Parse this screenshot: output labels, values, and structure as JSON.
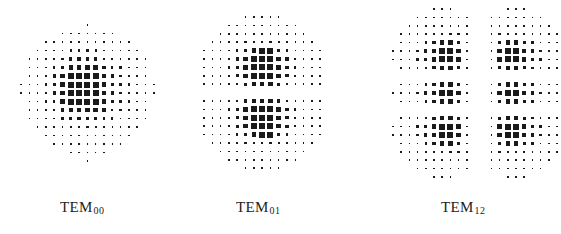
{
  "figure": {
    "panels": [
      {
        "id": "tem00",
        "label_main": "TEM",
        "label_sub": "00",
        "origin_x": 21,
        "origin_y": 25,
        "pitch_x": 8.3,
        "pitch_y": 8.5,
        "label_x": 60,
        "label_y": 199,
        "rows": [
          "00000000100000000",
          "00000111111100000",
          "00011111111111000",
          "00111122221111100",
          "01111233332211110",
          "01112344443221110",
          "01123455554322110",
          "11123455554332111",
          "11123455554322111",
          "01122455554322110",
          "01112344443221110",
          "01111233332211110",
          "00111122221111100",
          "00011111111111000",
          "00001111111110000",
          "00000011111000000",
          "00000000100000000"
        ]
      },
      {
        "id": "tem01",
        "label_main": "TEM",
        "label_sub": "01",
        "origin_x": 204,
        "origin_y": 17,
        "pitch_x": 8.3,
        "pitch_y": 8.4,
        "label_x": 236,
        "label_y": 199,
        "rows": [
          "000001111100000",
          "000111111111000",
          "001111111111100",
          "011112222211110",
          "111123455321111",
          "111234555432111",
          "111234555432111",
          "111234555432111",
          "111123444321111",
          "000000000000000",
          "111123444321111",
          "111234555432111",
          "111234555432111",
          "111234555432111",
          "111123455321111",
          "011112222211110",
          "001111111111100",
          "000111111111000",
          "000001111100000"
        ]
      },
      {
        "id": "tem12",
        "label_main": "TEM",
        "label_sub": "12",
        "origin_x": 393,
        "origin_y": 9,
        "pitch_x": 8.2,
        "pitch_y": 8.4,
        "label_x": 441,
        "label_y": 199,
        "rows": [
          "00000111000000111000000",
          "00011111110011111110000",
          "00111111110011111111000",
          "01111222210012222111100",
          "01112344310013443211100",
          "11123455410014554321110",
          "11123455410014554321110",
          "01112344310013443211100",
          "00000000000000000000000",
          "01112344310013443211100",
          "11123455410014554321110",
          "01112344310013443211100",
          "00000000000000000000000",
          "01112344310013443211100",
          "11123455410014554321110",
          "11123455410014554321110",
          "01112344310013443211100",
          "01111222210012222111100",
          "00111111110011111111000",
          "00011111110011111110000",
          "00000111000000111000000"
        ]
      }
    ],
    "dot_sizes": [
      0,
      1.6,
      2.4,
      3.4,
      4.6,
      6.0
    ],
    "dot_color": "#1a1a1a"
  }
}
